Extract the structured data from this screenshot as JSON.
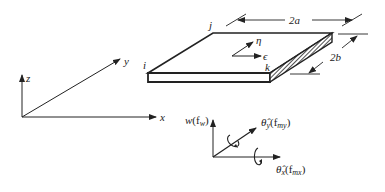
{
  "figure": {
    "global_axes": {
      "x_label": "x",
      "y_label": "y",
      "z_label": "z"
    },
    "plate": {
      "node_labels": {
        "i": "i",
        "j": "j",
        "k": "k"
      },
      "local_axes": {
        "eta_label": "η",
        "epsilon_label": "ϵ"
      },
      "dimensions": {
        "length_label": "2a",
        "width_label": "2b"
      }
    },
    "dof_axes": {
      "w_label": "w",
      "w_force": "(f",
      "w_force_sub": "w",
      "w_close": ")",
      "theta_y_label": "θ̂",
      "theta_y_sub": "y",
      "theta_y_force": "(f",
      "theta_y_force_sub": "my",
      "theta_x_label": "θ̂",
      "theta_x_sub": "x",
      "theta_x_force": "(f",
      "theta_x_force_sub": "mx",
      "close": ")"
    },
    "colors": {
      "ink": "#222222",
      "background": "#ffffff"
    }
  }
}
